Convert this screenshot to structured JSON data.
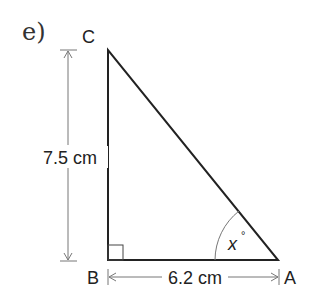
{
  "problem_label": "e)",
  "vertices": {
    "C": "C",
    "B": "B",
    "A": "A"
  },
  "dimensions": {
    "vertical": "7.5 cm",
    "horizontal": "6.2 cm"
  },
  "angle_label": "x",
  "angle_unit": "°",
  "colors": {
    "triangle": "#222222",
    "dimension": "#777777",
    "text": "#222222"
  }
}
